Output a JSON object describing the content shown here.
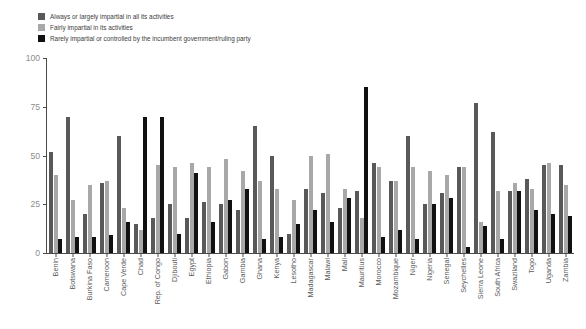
{
  "chart_data": {
    "type": "bar",
    "title": "",
    "subtitle": "",
    "xlabel": "",
    "ylabel": "",
    "ylim": [
      0,
      100
    ],
    "yticks": [
      0,
      25,
      50,
      75,
      100
    ],
    "grid": false,
    "legend_position": "top-left",
    "categories": [
      "Benin",
      "Botswana",
      "Burkina Faso",
      "Cameroon",
      "Cape Verde",
      "Chad",
      "Rep. of Congo",
      "Djibouti",
      "Egypt",
      "Ethiopia",
      "Gabon",
      "Gambia",
      "Ghana",
      "Kenya",
      "Lesotho",
      "Madagascar",
      "Malawi",
      "Mali",
      "Mauritius",
      "Morocco",
      "Mozambique",
      "Niger",
      "Nigeria",
      "Senegal",
      "Seychelles",
      "Sierra Leone",
      "South Africa",
      "Swaziland",
      "Togo",
      "Uganda",
      "Zambia"
    ],
    "series": [
      {
        "name": "Always or largely impartial in all its activities",
        "color": "#595959",
        "values": [
          52,
          70,
          20,
          36,
          60,
          15,
          18,
          25,
          18,
          26,
          25,
          22,
          65,
          50,
          10,
          33,
          31,
          23,
          32,
          46,
          37,
          60,
          25,
          31,
          44,
          77,
          62,
          32,
          38,
          45,
          45
        ]
      },
      {
        "name": "Fairly impartial in its activities",
        "color": "#a8a8a8",
        "values": [
          40,
          27,
          35,
          37,
          23,
          12,
          45,
          44,
          46,
          44,
          48,
          42,
          37,
          33,
          27,
          50,
          51,
          33,
          18,
          44,
          37,
          44,
          42,
          40,
          44,
          16,
          32,
          36,
          33,
          46,
          35
        ]
      },
      {
        "name": "Rarely impartial or controlled by the incumbent government/ruling party",
        "color": "#111111",
        "values": [
          7,
          8,
          8,
          9,
          16,
          70,
          70,
          10,
          41,
          16,
          27,
          33,
          7,
          8,
          15,
          22,
          16,
          28,
          85,
          8,
          12,
          7,
          25,
          28,
          3,
          14,
          7,
          32,
          22,
          20,
          19
        ]
      }
    ]
  }
}
